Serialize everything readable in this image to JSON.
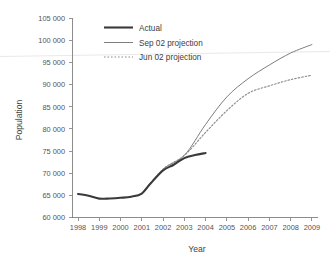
{
  "chart_data": {
    "type": "line",
    "title": "",
    "xlabel": "Year",
    "ylabel": "Population",
    "xlim": [
      1998,
      2009
    ],
    "ylim": [
      60000,
      105000
    ],
    "grid": false,
    "legend_position": "top-center",
    "x_tick_labels": [
      "1998",
      "1999",
      "2000",
      "2001",
      "2002",
      "2003",
      "2004",
      "2005",
      "2006",
      "2007",
      "2008",
      "2009"
    ],
    "y_tick_labels": [
      "60 000",
      "65 000",
      "70 000",
      "75 000",
      "80 000",
      "85 000",
      "90 000",
      "95 000",
      "100 000",
      "105 000"
    ],
    "y_ticks": [
      60000,
      65000,
      70000,
      75000,
      80000,
      85000,
      90000,
      95000,
      100000,
      105000
    ],
    "series": [
      {
        "name": "Actual",
        "style": "solid-thick",
        "color": "#3a3a3a",
        "x": [
          1998,
          1998.5,
          1999,
          1999.5,
          2000,
          2000.5,
          2001,
          2001.4,
          2002,
          2002.5,
          2003,
          2003.5,
          2004
        ],
        "values": [
          65300,
          64900,
          64250,
          64300,
          64450,
          64700,
          65400,
          67600,
          70600,
          71900,
          73400,
          74100,
          74550
        ]
      },
      {
        "name": "Sep 02 projection",
        "style": "solid-thin",
        "color": "#7d7d7d",
        "x": [
          2001,
          2002,
          2003,
          2004,
          2005,
          2006,
          2007,
          2008,
          2009
        ],
        "values": [
          65400,
          70900,
          74000,
          81000,
          87200,
          91300,
          94400,
          97100,
          99000
        ]
      },
      {
        "name": "Jun 02 projection",
        "style": "dotted",
        "color": "#8c8c8c",
        "x": [
          2001,
          2002,
          2003,
          2004,
          2005,
          2006,
          2007,
          2008,
          2009
        ],
        "values": [
          65400,
          70900,
          74000,
          79200,
          84100,
          88000,
          89700,
          91100,
          92100
        ]
      }
    ]
  },
  "legend": {
    "items": [
      {
        "label": "Actual"
      },
      {
        "label": "Sep 02 projection"
      },
      {
        "label": "Jun 02 projection"
      }
    ]
  },
  "axes": {
    "x_title": "Year",
    "y_title": "Population"
  }
}
